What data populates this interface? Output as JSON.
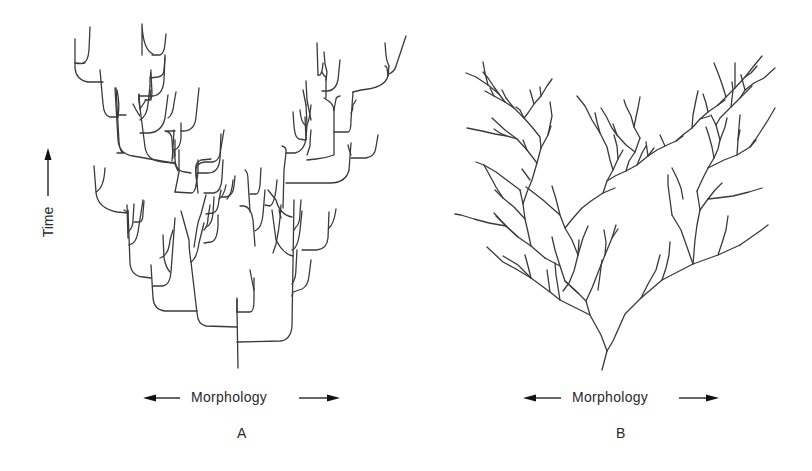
{
  "figure": {
    "type": "comparative evolutionary branching diagram",
    "y_axis": {
      "label": "Time",
      "direction": "up"
    },
    "panels": [
      {
        "id": "A",
        "letter": "A",
        "x_axis_label": "Morphology",
        "x_axis_direction": "both",
        "style": "rectangular branching: horizontal morphological shifts at branch points, vertical stasis along lineages"
      },
      {
        "id": "B",
        "letter": "B",
        "x_axis_label": "Morphology",
        "x_axis_direction": "both",
        "style": "diagonal branching: gradual morphological change along lineages"
      }
    ]
  },
  "colors": {
    "line": "#3a3a3a",
    "background": "#ffffff"
  }
}
